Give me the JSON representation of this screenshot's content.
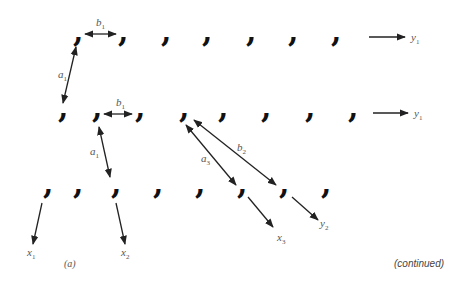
{
  "diagram": {
    "caption": "(a)",
    "continued_label": "(continued)",
    "node_glyph": "comma",
    "rows": [
      {
        "name": "row-1",
        "y": 38,
        "x": [
          77,
          122,
          165,
          206,
          250,
          292,
          335
        ]
      },
      {
        "name": "row-2",
        "y": 114,
        "x": [
          62,
          96,
          139,
          183,
          222,
          265,
          309,
          352
        ]
      },
      {
        "name": "row-3",
        "y": 190,
        "x": [
          47,
          77,
          115,
          157,
          199,
          241,
          283,
          325
        ]
      }
    ],
    "edges": [
      {
        "name": "b1-top",
        "label": "b",
        "sub": "1",
        "x1": 85,
        "y1": 34,
        "x2": 116,
        "y2": 34,
        "double": true,
        "lx": 96,
        "ly": 26
      },
      {
        "name": "a1",
        "label": "a",
        "sub": "1",
        "x1": 76,
        "y1": 47,
        "x2": 63,
        "y2": 103,
        "double": true,
        "lx": 58,
        "ly": 78
      },
      {
        "name": "b1-mid",
        "label": "b",
        "sub": "1",
        "x1": 104,
        "y1": 114,
        "x2": 132,
        "y2": 114,
        "double": true,
        "lx": 116,
        "ly": 106
      },
      {
        "name": "a2",
        "label": "a",
        "sub": "1",
        "x1": 99,
        "y1": 127,
        "x2": 110,
        "y2": 177,
        "double": true,
        "lx": 90,
        "ly": 155
      },
      {
        "name": "a3",
        "label": "a",
        "sub": "3",
        "x1": 186,
        "y1": 125,
        "x2": 236,
        "y2": 185,
        "double": true,
        "lx": 201,
        "ly": 162
      },
      {
        "name": "b2",
        "label": "b",
        "sub": "2",
        "x1": 194,
        "y1": 120,
        "x2": 276,
        "y2": 185,
        "double": true,
        "lx": 237,
        "ly": 151
      },
      {
        "name": "out-y1-top",
        "label": "y",
        "sub": "1",
        "x1": 369,
        "y1": 37,
        "x2": 405,
        "y2": 37,
        "double": false,
        "lx": 411,
        "ly": 41
      },
      {
        "name": "out-y1-mid",
        "label": "y",
        "sub": "1",
        "x1": 373,
        "y1": 113,
        "x2": 408,
        "y2": 113,
        "double": false,
        "lx": 414,
        "ly": 117
      },
      {
        "name": "out-x1",
        "label": "x",
        "sub": "1",
        "x1": 42,
        "y1": 203,
        "x2": 33,
        "y2": 244,
        "double": false,
        "lx": 27,
        "ly": 256
      },
      {
        "name": "out-x2",
        "label": "x",
        "sub": "2",
        "x1": 116,
        "y1": 203,
        "x2": 125,
        "y2": 244,
        "double": false,
        "lx": 121,
        "ly": 256
      },
      {
        "name": "out-x3",
        "label": "x",
        "sub": "3",
        "x1": 248,
        "y1": 197,
        "x2": 273,
        "y2": 227,
        "double": false,
        "lx": 277,
        "ly": 241
      },
      {
        "name": "out-y2",
        "label": "y",
        "sub": "2",
        "x1": 292,
        "y1": 197,
        "x2": 318,
        "y2": 220,
        "double": false,
        "lx": 320,
        "ly": 227
      }
    ]
  }
}
